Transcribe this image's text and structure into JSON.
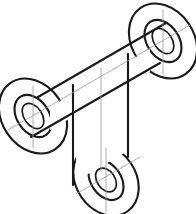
{
  "drawing": {
    "title": "Isometric pictorial of a three-lug bracket",
    "view_type": "isometric",
    "background_color": "#ffffff",
    "line_color": "#1a1a1a",
    "centerline_color": "#9a9a9a",
    "parts": [
      {
        "name": "top-right-boss",
        "label": "Top right cylindrical boss with through hole",
        "center_x": 163,
        "center_y": 41,
        "outer_rx": 31,
        "outer_ry": 40,
        "hole_outer_rx": 16,
        "hole_outer_ry": 23,
        "hole_inner_rx": 9,
        "hole_inner_ry": 14,
        "rotation_deg": -34
      },
      {
        "name": "left-boss",
        "label": "Left cylindrical boss with through hole",
        "center_x": 33,
        "center_y": 116,
        "outer_rx": 31,
        "outer_ry": 40,
        "hole_outer_rx": 16,
        "hole_outer_ry": 23,
        "hole_inner_rx": 9,
        "hole_inner_ry": 14,
        "rotation_deg": -34
      },
      {
        "name": "bottom-boss",
        "label": "Bottom cylindrical boss with through hole",
        "center_x": 106,
        "center_y": 180,
        "outer_rx": 30,
        "outer_ry": 38,
        "hole_outer_rx": 15,
        "hole_outer_ry": 22,
        "hole_inner_rx": 9,
        "hole_inner_ry": 13,
        "rotation_deg": -34
      },
      {
        "name": "upper-plate",
        "label": "Upper inclined connecting plate between left and top-right bosses"
      },
      {
        "name": "lower-arm",
        "label": "Lower vertical arm joining plate to bottom boss"
      }
    ],
    "construction_lines": [
      {
        "name": "main-axis-centerline",
        "label": "Axis centerline through left and top-right boss centers"
      },
      {
        "name": "bottom-axis-centerline",
        "label": "Axis centerline through bottom boss"
      },
      {
        "name": "plate-mid-centerline",
        "label": "Vertical centerline of upper plate"
      },
      {
        "name": "arm-centerline",
        "label": "Vertical centerline of lower arm"
      }
    ]
  }
}
